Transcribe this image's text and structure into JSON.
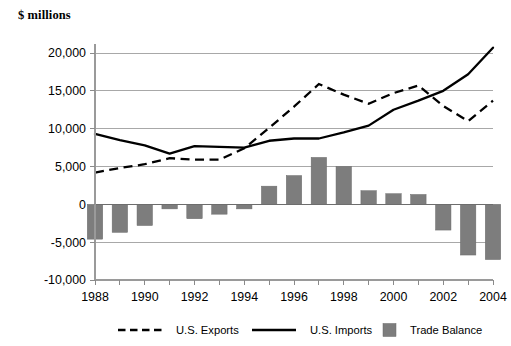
{
  "chart_data": {
    "type": "bar",
    "title": "",
    "ylabel": "$ millions",
    "xlabel": "",
    "ylim": [
      -10000,
      22500
    ],
    "yticks": [
      20000,
      15000,
      10000,
      5000,
      0,
      -5000,
      -10000
    ],
    "ytick_labels": [
      "20,000",
      "15,000",
      "10,000",
      "5,000",
      "0",
      "-5,000",
      "-10,000"
    ],
    "grid": true,
    "legend_position": "bottom",
    "categories": [
      1988,
      1989,
      1990,
      1991,
      1992,
      1993,
      1994,
      1995,
      1996,
      1997,
      1998,
      1999,
      2000,
      2001,
      2002,
      2003,
      2004
    ],
    "xtick_labels": [
      "1988",
      "1990",
      "1992",
      "1994",
      "1996",
      "1998",
      "2000",
      "2002",
      "2004"
    ],
    "xtick_values": [
      1988,
      1990,
      1992,
      1994,
      1996,
      1998,
      2000,
      2002,
      2004
    ],
    "series": [
      {
        "name": "U.S. Exports",
        "type": "line",
        "style": "dashed",
        "color": "#000000",
        "values": [
          4200,
          4800,
          5300,
          6100,
          5900,
          5900,
          7400,
          10100,
          12900,
          15900,
          14500,
          13300,
          14700,
          15700,
          13000,
          11000,
          13700
        ]
      },
      {
        "name": "U.S. Imports",
        "type": "line",
        "style": "solid",
        "color": "#000000",
        "values": [
          9300,
          8500,
          7800,
          6700,
          7700,
          7600,
          7500,
          8400,
          8700,
          8700,
          9500,
          10400,
          12500,
          13700,
          15000,
          17200,
          20700
        ]
      },
      {
        "name": "Trade Balance",
        "type": "bar",
        "color": "#7d7d7d",
        "values": [
          -4600,
          -3700,
          -2800,
          -600,
          -1900,
          -1300,
          -600,
          2400,
          3800,
          6200,
          5000,
          1800,
          1400,
          1300,
          -3400,
          -6700,
          -7300
        ]
      }
    ],
    "legend": [
      {
        "label": "U.S. Exports",
        "marker": "dashed-line"
      },
      {
        "label": "U.S. Imports",
        "marker": "solid-line"
      },
      {
        "label": "Trade Balance",
        "marker": "gray-square"
      }
    ]
  }
}
